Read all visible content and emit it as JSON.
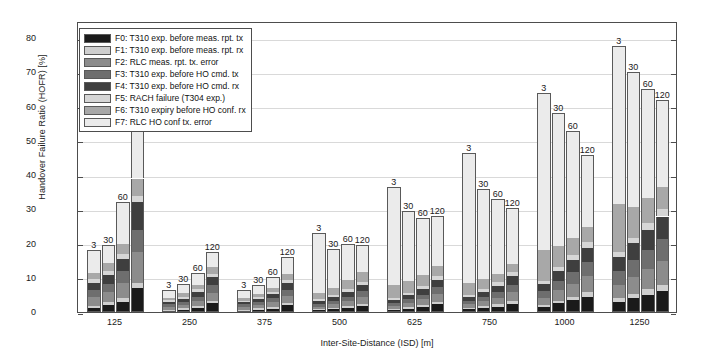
{
  "chart_data": {
    "type": "bar",
    "subtype": "stacked-grouped",
    "title": "",
    "xlabel": "Inter-Site-Distance (ISD) [m]",
    "ylabel": "Handover Failure Ratio (HOFR) [%]",
    "ylim": [
      0,
      85
    ],
    "yticks": [
      0,
      10,
      20,
      30,
      40,
      50,
      60,
      70,
      80
    ],
    "grid": true,
    "legend_position": "upper-left-inside",
    "categories": [
      "125",
      "250",
      "375",
      "500",
      "625",
      "750",
      "1000",
      "1250"
    ],
    "subcategories": [
      "3",
      "30",
      "60",
      "120"
    ],
    "subcategory_name": "UE speed [km/h]",
    "legend": [
      {
        "key": "F0",
        "label": "F0: T310 exp. before meas. rpt. tx",
        "color": "#1a1a1a"
      },
      {
        "key": "F1",
        "label": "F1: T310 exp. before meas. rpt. rx",
        "color": "#cfcfcf"
      },
      {
        "key": "F2",
        "label": "F2: RLC meas. rpt. tx. error",
        "color": "#8c8c8c"
      },
      {
        "key": "F3",
        "label": "F3: T310 exp. before HO cmd. tx",
        "color": "#6e6e6e"
      },
      {
        "key": "F4",
        "label": "F4: T310 exp. before HO cmd. rx",
        "color": "#3f3f3f"
      },
      {
        "key": "F5",
        "label": "F5: RACH failure (T304 exp.)",
        "color": "#d6d6d6"
      },
      {
        "key": "F6",
        "label": "F6: T310 expiry before HO conf. rx",
        "color": "#a8a8a8"
      },
      {
        "key": "F7",
        "label": "F7: RLC HO conf tx. error",
        "color": "#ebebeb"
      }
    ],
    "series": [
      {
        "name": "F0: T310 exp. before meas. rpt. tx",
        "color": "#1a1a1a",
        "values": [
          [
            1.2,
            2.0,
            3.0,
            7.0
          ],
          [
            0.4,
            0.7,
            1.2,
            2.5
          ],
          [
            0.4,
            0.7,
            1.0,
            2.0
          ],
          [
            0.5,
            0.8,
            1.2,
            2.0
          ],
          [
            0.6,
            1.0,
            1.5,
            2.2
          ],
          [
            0.8,
            1.2,
            1.6,
            2.4
          ],
          [
            1.5,
            2.5,
            3.5,
            4.5
          ],
          [
            3.0,
            4.0,
            5.0,
            6.0
          ]
        ]
      },
      {
        "name": "F1: T310 exp. before meas. rpt. rx",
        "color": "#cfcfcf",
        "values": [
          [
            0.6,
            0.8,
            1.0,
            1.5
          ],
          [
            0.3,
            0.4,
            0.5,
            0.7
          ],
          [
            0.3,
            0.4,
            0.5,
            0.7
          ],
          [
            0.3,
            0.4,
            0.5,
            0.7
          ],
          [
            0.3,
            0.4,
            0.6,
            0.8
          ],
          [
            0.4,
            0.5,
            0.7,
            0.9
          ],
          [
            0.6,
            0.8,
            1.0,
            1.3
          ],
          [
            1.0,
            1.3,
            1.6,
            1.9
          ]
        ]
      },
      {
        "name": "F2: RLC meas. rpt. tx. error",
        "color": "#8c8c8c",
        "values": [
          [
            2.5,
            3.0,
            4.5,
            9.0
          ],
          [
            0.8,
            1.0,
            1.5,
            2.5
          ],
          [
            0.8,
            1.0,
            1.3,
            2.0
          ],
          [
            0.8,
            1.1,
            1.5,
            2.2
          ],
          [
            0.9,
            1.2,
            1.6,
            2.3
          ],
          [
            1.0,
            1.5,
            1.9,
            2.5
          ],
          [
            2.0,
            3.0,
            3.8,
            4.6
          ],
          [
            4.0,
            5.0,
            6.0,
            7.0
          ]
        ]
      },
      {
        "name": "F3: T310 exp. before HO cmd. tx",
        "color": "#6e6e6e",
        "values": [
          [
            2.2,
            2.5,
            3.5,
            6.5
          ],
          [
            0.7,
            0.9,
            1.3,
            2.2
          ],
          [
            0.7,
            0.9,
            1.2,
            1.8
          ],
          [
            0.8,
            1.0,
            1.3,
            1.9
          ],
          [
            0.8,
            1.1,
            1.4,
            2.0
          ],
          [
            1.0,
            1.3,
            1.7,
            2.2
          ],
          [
            2.0,
            2.7,
            3.4,
            4.1
          ],
          [
            4.0,
            4.8,
            5.6,
            6.4
          ]
        ]
      },
      {
        "name": "F4: T310 exp. before HO cmd. rx",
        "color": "#3f3f3f",
        "values": [
          [
            2.0,
            2.5,
            3.5,
            8.0
          ],
          [
            0.7,
            0.9,
            1.3,
            2.3
          ],
          [
            0.7,
            0.9,
            1.2,
            1.9
          ],
          [
            0.8,
            1.0,
            1.4,
            2.0
          ],
          [
            0.9,
            1.2,
            1.5,
            2.1
          ],
          [
            1.1,
            1.4,
            1.8,
            2.4
          ],
          [
            2.2,
            2.9,
            3.6,
            4.3
          ],
          [
            4.2,
            5.0,
            5.8,
            6.6
          ]
        ]
      },
      {
        "name": "F5: RACH failure (T304 exp.)",
        "color": "#d6d6d6",
        "values": [
          [
            1.0,
            1.2,
            1.5,
            2.0
          ],
          [
            0.5,
            0.6,
            0.8,
            1.0
          ],
          [
            0.4,
            0.5,
            0.7,
            0.9
          ],
          [
            0.5,
            0.6,
            0.8,
            1.0
          ],
          [
            0.5,
            0.7,
            0.9,
            1.1
          ],
          [
            0.6,
            0.8,
            1.0,
            1.2
          ],
          [
            0.9,
            1.1,
            1.4,
            1.7
          ],
          [
            1.3,
            1.6,
            1.9,
            2.2
          ]
        ]
      },
      {
        "name": "F6: T310 expiry before HO conf. rx",
        "color": "#a8a8a8",
        "values": [
          [
            2.0,
            2.3,
            3.0,
            5.0
          ],
          [
            0.8,
            1.0,
            1.4,
            2.0
          ],
          [
            0.7,
            0.9,
            1.2,
            1.7
          ],
          [
            2.0,
            2.2,
            2.6,
            3.0
          ],
          [
            4.0,
            3.5,
            3.2,
            3.0
          ],
          [
            3.5,
            2.8,
            2.5,
            2.3
          ],
          [
            9.0,
            6.0,
            5.0,
            4.2
          ],
          [
            14.0,
            9.0,
            7.5,
            6.5
          ]
        ]
      },
      {
        "name": "F7: RLC HO conf tx. error",
        "color": "#ebebeb",
        "values": [
          [
            6.5,
            5.2,
            12.0,
            16.0
          ],
          [
            2.3,
            2.8,
            3.5,
            4.3
          ],
          [
            2.5,
            2.6,
            3.2,
            5.0
          ],
          [
            17.3,
            11.3,
            10.5,
            8.7
          ],
          [
            28.6,
            20.4,
            16.8,
            14.5
          ],
          [
            38.1,
            26.5,
            21.8,
            16.6
          ],
          [
            45.8,
            38.0,
            31.3,
            21.3
          ],
          [
            46.3,
            39.3,
            31.6,
            25.4
          ]
        ]
      }
    ],
    "bar_totals": [
      [
        18.0,
        19.5,
        32.0,
        55.0
      ],
      [
        6.5,
        8.3,
        11.5,
        17.5
      ],
      [
        6.5,
        7.9,
        10.3,
        16.0
      ],
      [
        23.0,
        18.4,
        19.8,
        19.5
      ],
      [
        36.6,
        29.5,
        27.5,
        28.0
      ],
      [
        46.5,
        36.0,
        33.0,
        30.5
      ],
      [
        64.0,
        58.0,
        53.0,
        46.0
      ],
      [
        77.8,
        70.0,
        65.0,
        62.0
      ]
    ],
    "bar_value_labels": [
      [
        "3",
        "30",
        "60",
        "120"
      ],
      [
        "3",
        "30",
        "60",
        "120"
      ],
      [
        "3",
        "30",
        "60",
        "120"
      ],
      [
        "3",
        "30",
        "60",
        "120"
      ],
      [
        "3",
        "30",
        "60",
        "120"
      ],
      [
        "3",
        "30",
        "60",
        "120"
      ],
      [
        "3",
        "30",
        "60",
        "120"
      ],
      [
        "3",
        "30",
        "60",
        "120"
      ]
    ]
  }
}
